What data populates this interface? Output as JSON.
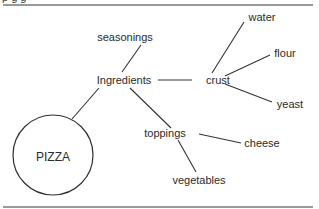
{
  "header": {
    "cut_off_text": "p                   g                                   g"
  },
  "diagram": {
    "nodes": {
      "pizza": "PIZZA",
      "ingredients": "Ingredients",
      "seasonings": "seasonings",
      "crust": "crust",
      "water": "water",
      "flour": "flour",
      "yeast": "yeast",
      "toppings": "toppings",
      "cheese": "cheese",
      "vegetables": "vegetables"
    },
    "edges": [
      [
        "pizza",
        "ingredients"
      ],
      [
        "ingredients",
        "seasonings"
      ],
      [
        "ingredients",
        "crust"
      ],
      [
        "ingredients",
        "toppings"
      ],
      [
        "crust",
        "water"
      ],
      [
        "crust",
        "flour"
      ],
      [
        "crust",
        "yeast"
      ],
      [
        "toppings",
        "cheese"
      ],
      [
        "toppings",
        "vegetables"
      ]
    ]
  },
  "colors": {
    "line": "#3a3a3a",
    "rule": "#6f6f6f",
    "text": "#2a2a2a"
  }
}
